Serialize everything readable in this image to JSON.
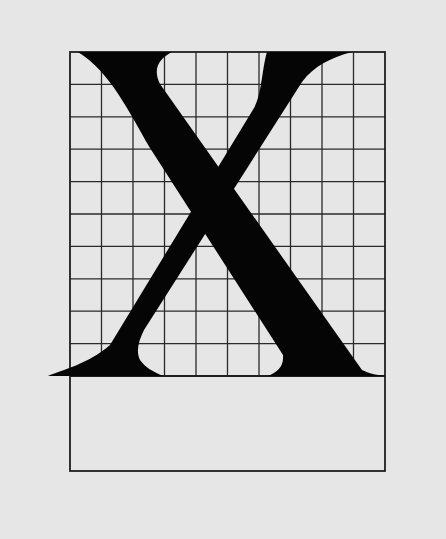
{
  "diagram": {
    "letter": "X",
    "colors": {
      "background": "#e6e6e6",
      "grid_line": "#2a2a2a",
      "glyph": "#050505"
    },
    "grid": {
      "columns": 10,
      "rows": 10,
      "left": 70,
      "top": 52,
      "right": 385,
      "baseline": 376
    },
    "lower_box": {
      "top": 376,
      "bottom": 471
    }
  }
}
